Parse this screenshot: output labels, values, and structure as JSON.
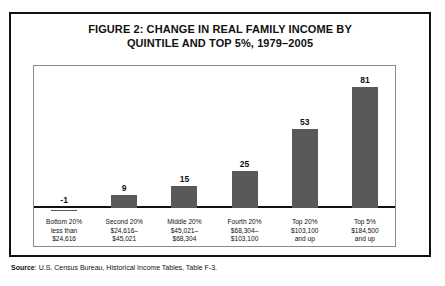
{
  "figure": {
    "title_line1": "FIGURE 2:  CHANGE IN REAL FAMILY INCOME BY",
    "title_line2": "QUINTILE AND TOP 5%, 1979–2005",
    "source_label": "Source",
    "source_separator": ":",
    "source_text": "U.S. Census Bureau, Historical Income Tables, Table F-3."
  },
  "colors": {
    "bar_fill": "#595959",
    "frame": "#111111",
    "plot_border": "#8a8a8a",
    "text": "#111111"
  },
  "chart_data": {
    "type": "bar",
    "title": "FIGURE 2:  CHANGE IN REAL FAMILY INCOME BY QUINTILE AND TOP 5%, 1979–2005",
    "xlabel": "",
    "ylabel": "",
    "ylim": [
      -1,
      90
    ],
    "grid": false,
    "legend": "none",
    "categories": [
      "Bottom 20%\nless than\n$24,616",
      "Second 20%\n$24,616–\n$45,021",
      "Middle 20%\n$45,021–\n$68,304",
      "Fourth 20%\n$68,304–\n$103,100",
      "Top 20%\n$103,100\nand up",
      "Top 5%\n$184,500\nand up"
    ],
    "values": [
      -1,
      9,
      15,
      25,
      53,
      81
    ],
    "value_labels": [
      "-1",
      "9",
      "15",
      "25",
      "53",
      "81"
    ],
    "bars": [
      {
        "value": -1,
        "label": "-1",
        "name": "Bottom 20%",
        "tick_lines": [
          "Bottom 20%",
          "less than",
          "$24,616"
        ]
      },
      {
        "value": 9,
        "label": "9",
        "name": "Second 20%",
        "tick_lines": [
          "Second 20%",
          "$24,616–",
          "$45,021"
        ]
      },
      {
        "value": 15,
        "label": "15",
        "name": "Middle 20%",
        "tick_lines": [
          "Middle 20%",
          "$45,021–",
          "$68,304"
        ]
      },
      {
        "value": 25,
        "label": "25",
        "name": "Fourth 20%",
        "tick_lines": [
          "Fourth 20%",
          "$68,304–",
          "$103,100"
        ]
      },
      {
        "value": 53,
        "label": "53",
        "name": "Top 20%",
        "tick_lines": [
          "Top 20%",
          "$103,100",
          "and up"
        ]
      },
      {
        "value": 81,
        "label": "81",
        "name": "Top 5%",
        "tick_lines": [
          "Top 5%",
          "$184,500",
          "and up"
        ]
      }
    ]
  }
}
